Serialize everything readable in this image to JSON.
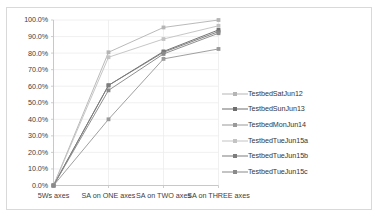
{
  "chart_data": {
    "type": "line",
    "title": "",
    "xlabel": "",
    "ylabel": "",
    "categories": [
      "5Ws axes",
      "SA on ONE axes",
      "SA on TWO axes",
      "SA on THREE axes"
    ],
    "ylim": [
      0,
      100
    ],
    "ytick_labels": [
      "100.0%",
      "90.0%",
      "80.0%",
      "70.0%",
      "60.0%",
      "50.0%",
      "40.0%",
      "30.0%",
      "20.0%",
      "10.0%",
      "0.0%"
    ],
    "ytick_values": [
      100,
      90,
      80,
      70,
      60,
      50,
      40,
      30,
      20,
      10,
      0
    ],
    "grid": true,
    "legend_position": "right",
    "series": [
      {
        "name": "TestbedSatJun12",
        "values": [
          0,
          80.5,
          95.5,
          100.0
        ],
        "color": "#b5b5b5",
        "marker": "square"
      },
      {
        "name": "TestbedSunJun13",
        "values": [
          0,
          60.5,
          81.0,
          94.0
        ],
        "color": "#6e6e6e",
        "marker": "square"
      },
      {
        "name": "TestbedMonJun14",
        "values": [
          0,
          40.0,
          76.5,
          82.5
        ],
        "color": "#9a9a9a",
        "marker": "square"
      },
      {
        "name": "TestbedTueJun15a",
        "values": [
          0,
          77.5,
          88.5,
          96.5
        ],
        "color": "#c3c3c3",
        "marker": "square"
      },
      {
        "name": "TestbedTueJun15b",
        "values": [
          0,
          60.5,
          80.5,
          93.0
        ],
        "color": "#7d7d7d",
        "marker": "square"
      },
      {
        "name": "TestbedTueJun15c",
        "values": [
          0,
          57.5,
          79.5,
          92.0
        ],
        "color": "#8a8a8a",
        "marker": "square"
      }
    ]
  }
}
